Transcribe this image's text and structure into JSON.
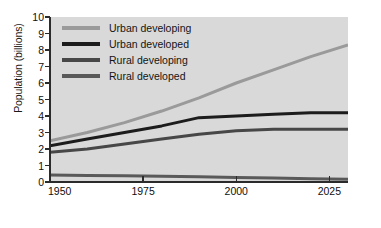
{
  "chart_data": {
    "type": "line",
    "title": "",
    "xlabel": "",
    "ylabel": "Population (billions)",
    "xlim": [
      1950,
      2030
    ],
    "ylim": [
      0,
      10
    ],
    "grid": false,
    "legend_position": "top-left",
    "xticks": [
      "1950",
      "1975",
      "2000",
      "2025"
    ],
    "xtick_values": [
      1950,
      1975,
      2000,
      2025
    ],
    "yticks": [
      "0",
      "1",
      "2",
      "3",
      "4",
      "5",
      "6",
      "7",
      "8",
      "9",
      "10"
    ],
    "ytick_values": [
      0,
      1,
      2,
      3,
      4,
      5,
      6,
      7,
      8,
      9,
      10
    ],
    "x": [
      1950,
      1960,
      1970,
      1980,
      1990,
      2000,
      2010,
      2020,
      2030
    ],
    "series": [
      {
        "name": "Urban developing",
        "color": "#9a9a9a",
        "values": [
          2.5,
          3.0,
          3.6,
          4.3,
          5.1,
          6.0,
          6.8,
          7.6,
          8.3
        ]
      },
      {
        "name": "Urban developed",
        "color": "#1c1c1c",
        "values": [
          2.2,
          2.6,
          3.0,
          3.4,
          3.9,
          4.0,
          4.1,
          4.2,
          4.2
        ]
      },
      {
        "name": "Rural developing",
        "color": "#474747",
        "values": [
          1.8,
          2.0,
          2.3,
          2.6,
          2.9,
          3.1,
          3.2,
          3.2,
          3.2
        ]
      },
      {
        "name": "Rural developed",
        "color": "#595959",
        "values": [
          0.42,
          0.4,
          0.38,
          0.35,
          0.32,
          0.28,
          0.24,
          0.2,
          0.16
        ]
      }
    ]
  },
  "legend": {
    "items": [
      {
        "label": "Urban developing",
        "color": "#9a9a9a"
      },
      {
        "label": "Urban developed",
        "color": "#1c1c1c"
      },
      {
        "label": "Rural developing",
        "color": "#474747"
      },
      {
        "label": "Rural developed",
        "color": "#595959"
      }
    ]
  },
  "colors": {
    "plot_background": "#d9d9d9",
    "figure_background": "#ffffff",
    "axis": "#2b2b2b",
    "text": "#111111"
  }
}
